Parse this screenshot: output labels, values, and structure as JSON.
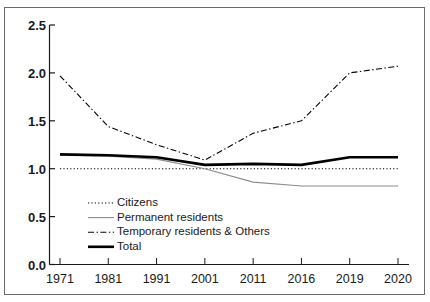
{
  "chart_data": {
    "type": "line",
    "title": "",
    "xlabel": "",
    "ylabel": "",
    "categories": [
      "1971",
      "1981",
      "1991",
      "2001",
      "2011",
      "2016",
      "2019",
      "2020"
    ],
    "ylim": [
      0.0,
      2.5
    ],
    "yticks": [
      "0.0",
      "0.5",
      "1.0",
      "1.5",
      "2.0",
      "2.5"
    ],
    "ytick_values": [
      0.0,
      0.5,
      1.0,
      1.5,
      2.0,
      2.5
    ],
    "grid": false,
    "legend_position": "lower-left-inside",
    "series": [
      {
        "name": "Citizens",
        "style": "dotted",
        "color": "#000000",
        "width": 1.1,
        "values": [
          1.0,
          1.0,
          1.0,
          1.0,
          1.0,
          1.0,
          1.0,
          1.0
        ]
      },
      {
        "name": "Permanent residents",
        "style": "solid-thin",
        "color": "#8c8c8c",
        "width": 1.1,
        "values": [
          1.14,
          1.13,
          1.1,
          1.0,
          0.86,
          0.82,
          0.82,
          0.82
        ]
      },
      {
        "name": "Temporary residents & Others",
        "style": "dash-dot",
        "color": "#000000",
        "width": 1.1,
        "values": [
          1.97,
          1.44,
          1.25,
          1.09,
          1.37,
          1.5,
          2.0,
          2.07
        ]
      },
      {
        "name": "Total",
        "style": "solid-thick",
        "color": "#000000",
        "width": 2.6,
        "values": [
          1.15,
          1.14,
          1.12,
          1.04,
          1.05,
          1.04,
          1.12,
          1.12
        ]
      }
    ]
  },
  "legend": {
    "items": [
      {
        "label": "Citizens"
      },
      {
        "label": "Permanent residents"
      },
      {
        "label": "Temporary residents & Others"
      },
      {
        "label": "Total"
      }
    ]
  }
}
